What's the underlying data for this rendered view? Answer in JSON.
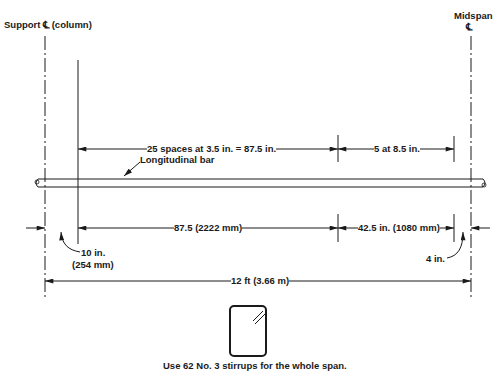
{
  "labels": {
    "support_cl": "Support ℄ (column)",
    "midspan": "Midspan",
    "midspan_cl_symbol": "℄",
    "top_spacing_1": "25 spaces at 3.5 in. = 87.5 in.",
    "top_spacing_2": "5 at 8.5 in.",
    "longitudinal_bar": "Longitudinal bar",
    "bottom_dim_1": "87.5 (2222 mm)",
    "bottom_dim_2": "42.5 in. (1080 mm)",
    "left_offset_1": "10 in.",
    "left_offset_2": "(254 mm)",
    "right_offset": "4 in.",
    "total_length": "12 ft (3.66 m)",
    "note": "Use 62 No. 3 stirrups for the whole span."
  },
  "colors": {
    "line": "#1a1a1a",
    "background": "#ffffff"
  }
}
